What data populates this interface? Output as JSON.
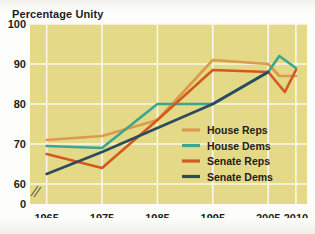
{
  "figure": {
    "axis_title": "Percentage Unity",
    "plot_background": "#e3d987",
    "gridline_color": "#fbfaf2",
    "page_background": "#fdfdfb",
    "text_color": "#1d1d1b"
  },
  "chart_data": {
    "type": "line",
    "title": "Percentage Unity",
    "xlabel": "",
    "ylabel": "Percentage Unity",
    "xlim": [
      1962,
      2012
    ],
    "ylim": [
      55,
      100
    ],
    "yticks": [
      0,
      60,
      70,
      80,
      90,
      100
    ],
    "ytick_labels": [
      "0",
      "60",
      "70",
      "80",
      "90",
      "100"
    ],
    "xticks": [
      1965,
      1975,
      1985,
      1995,
      2005,
      2010
    ],
    "xtick_labels": [
      "1965",
      "1975",
      "1985",
      "1995",
      "2005",
      "2010"
    ],
    "grid": true,
    "axis_break": true,
    "legend_position": "center-right",
    "series": [
      {
        "name": "House Reps",
        "color": "#dd9a4c",
        "x": [
          1965,
          1975,
          1985,
          1995,
          2005,
          2007,
          2010
        ],
        "values": [
          71,
          72,
          76,
          91,
          90,
          87,
          87
        ]
      },
      {
        "name": "House Dems",
        "color": "#3da68e",
        "x": [
          1965,
          1975,
          1985,
          1990,
          1995,
          2005,
          2007,
          2010
        ],
        "values": [
          69.5,
          69,
          80,
          80,
          80,
          88,
          92,
          89
        ]
      },
      {
        "name": "Senate Reps",
        "color": "#d4581f",
        "x": [
          1965,
          1975,
          1985,
          1995,
          2005,
          2008,
          2010
        ],
        "values": [
          67.5,
          64,
          76,
          88.5,
          88,
          83,
          88.5
        ]
      },
      {
        "name": "Senate Dems",
        "color": "#2d4a5e",
        "x": [
          1965,
          1975,
          1985,
          1995,
          2005
        ],
        "values": [
          62.5,
          68,
          74,
          80,
          88
        ]
      }
    ]
  },
  "legend": {
    "items": [
      {
        "label": "House Reps",
        "color": "#dd9a4c"
      },
      {
        "label": "House Dems",
        "color": "#3da68e"
      },
      {
        "label": "Senate Reps",
        "color": "#d4581f"
      },
      {
        "label": "Senate Dems",
        "color": "#2d4a5e"
      }
    ]
  }
}
